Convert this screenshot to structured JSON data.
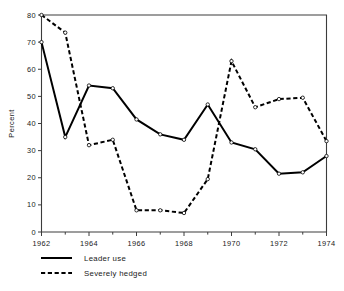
{
  "chart_data": {
    "type": "line",
    "title": "",
    "xlabel": "",
    "ylabel": "Percent",
    "xlim": [
      1962,
      1974
    ],
    "ylim": [
      0,
      80
    ],
    "grid": false,
    "legend_position": "below-left",
    "x": [
      1962,
      1963,
      1964,
      1965,
      1966,
      1967,
      1968,
      1969,
      1970,
      1971,
      1972,
      1973,
      1974
    ],
    "xtick_labels": [
      "1962",
      "1964",
      "1966",
      "1968",
      "1970",
      "1972",
      "1974"
    ],
    "xtick_values": [
      1962,
      1964,
      1966,
      1968,
      1970,
      1972,
      1974
    ],
    "xminor_values": [
      1963,
      1965,
      1967,
      1969,
      1971,
      1973
    ],
    "ytick_labels": [
      "0",
      "10",
      "20",
      "30",
      "40",
      "50",
      "60",
      "70",
      "80"
    ],
    "ytick_values": [
      0,
      10,
      20,
      30,
      40,
      50,
      60,
      70,
      80
    ],
    "series": [
      {
        "name": "Leader use",
        "style": "solid",
        "values": [
          70,
          35,
          54,
          53,
          41.5,
          36,
          34,
          47,
          33,
          30.5,
          21.5,
          22,
          28
        ]
      },
      {
        "name": "Severely hedged",
        "style": "dashed",
        "values": [
          80,
          73.5,
          32,
          34,
          8,
          8,
          7,
          19.5,
          63,
          46,
          49,
          49.5,
          33.5
        ]
      }
    ]
  },
  "legend": {
    "items": [
      {
        "label": "Leader use",
        "style": "solid"
      },
      {
        "label": "Severely hedged",
        "style": "dashed"
      }
    ]
  },
  "caption": {
    "text": ""
  }
}
